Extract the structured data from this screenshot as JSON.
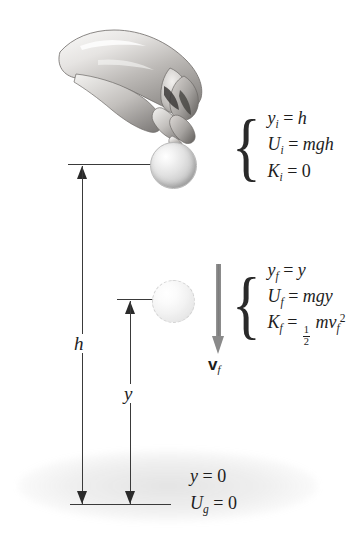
{
  "figure": {
    "ink_color": "#1d1d1d",
    "arrow_gray": "#8a8a8a"
  },
  "hand": {
    "icon": "hand-releasing-ball-photo",
    "description": "Grayscale photograph of a hand releasing a ball"
  },
  "balls": [
    {
      "name": "ball-initial",
      "state": "held"
    },
    {
      "name": "ball-final",
      "state": "falling"
    }
  ],
  "measurements": {
    "height_h": {
      "label": "h",
      "from": "ground",
      "to": "initial-position"
    },
    "height_y": {
      "label": "y",
      "from": "ground",
      "to": "final-position"
    }
  },
  "velocity": {
    "symbol": "v",
    "subscript": "f",
    "arrow_direction": "down"
  },
  "equations_initial": [
    {
      "lhs": "y",
      "lhs_sub": "i",
      "rhs": "h"
    },
    {
      "lhs": "U",
      "lhs_sub": "i",
      "rhs": "mgh"
    },
    {
      "lhs": "K",
      "lhs_sub": "i",
      "rhs": "0"
    }
  ],
  "equations_final": [
    {
      "lhs": "y",
      "lhs_sub": "f",
      "rhs": "y"
    },
    {
      "lhs": "U",
      "lhs_sub": "f",
      "rhs": "mgy"
    },
    {
      "lhs": "K",
      "lhs_sub": "f",
      "rhs_frac_num": "1",
      "rhs_frac_den": "2",
      "rhs_tail": "mv",
      "rhs_tail_sub": "f",
      "rhs_tail_sup": "2"
    }
  ],
  "ground_labels": [
    {
      "lhs": "y",
      "lhs_sub": "",
      "rhs": "0"
    },
    {
      "lhs": "U",
      "lhs_sub": "g",
      "rhs": "0"
    }
  ],
  "brace_glyph": "{",
  "equals": "="
}
